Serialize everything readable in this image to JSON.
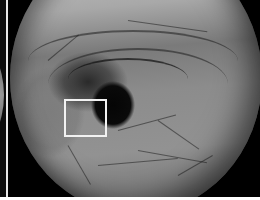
{
  "image": {
    "description": "Grayscale endoscopic view of mucosa with dark central lumen and a white rectangular region-of-interest box",
    "colors": {
      "background": "#000000",
      "mucosa_light": "#c9c9c9",
      "mucosa_mid": "#8c8c8c",
      "lumen": "#050505",
      "roi_box": "#f2f2f2",
      "separator": "#e8e8e8"
    },
    "roi_box": {
      "x": 64,
      "y": 99,
      "width": 42,
      "height": 37
    },
    "lumen": {
      "cx": 110,
      "cy": 105,
      "r": 22
    }
  }
}
